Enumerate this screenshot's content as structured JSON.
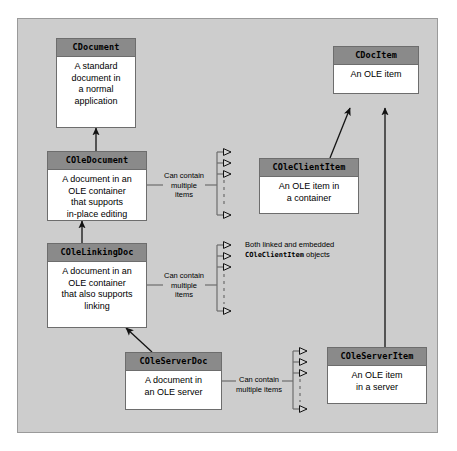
{
  "diagram": {
    "type": "uml-class-diagram",
    "panel_background": "#cdcdcd",
    "header_fill": "#8a8a8a",
    "body_fill": "#ffffff",
    "line_color": "#6d6d6d"
  },
  "classes": [
    {
      "id": "cdocument",
      "name": "CDocument",
      "description": "A standard\ndocument in\na normal\napplication"
    },
    {
      "id": "coledocument",
      "name": "COleDocument",
      "description": "A document in an\nOLE container\nthat supports\nin-place editing"
    },
    {
      "id": "colelinkingdoc",
      "name": "COleLinkingDoc",
      "description": "A document in an\nOLE container\nthat also supports\nlinking"
    },
    {
      "id": "coleserverdoc",
      "name": "COleServerDoc",
      "description": "A document in\nan OLE server"
    },
    {
      "id": "cdocitem",
      "name": "CDocItem",
      "description": "An OLE item"
    },
    {
      "id": "coleclientitem",
      "name": "COleClientItem",
      "description": "An OLE item in\na container"
    },
    {
      "id": "coleserveritem",
      "name": "COleServerItem",
      "description": "An OLE item\nin a server"
    }
  ],
  "edge_labels": {
    "coledocument_contains": "Can contain\nmultiple\nitems",
    "colelinkingdoc_contains": "Can contain\nmultiple\nitems",
    "coleserverdoc_contains": "Can contain\nmultiple items"
  },
  "notes": {
    "linking_note_line1": "Both linked and embedded",
    "linking_note_mono": "COleClientItem",
    "linking_note_line2_tail": " objects"
  },
  "relationships": [
    {
      "from": "coledocument",
      "to": "cdocument",
      "kind": "inheritance"
    },
    {
      "from": "colelinkingdoc",
      "to": "coledocument",
      "kind": "inheritance"
    },
    {
      "from": "coleserverdoc",
      "to": "colelinkingdoc",
      "kind": "inheritance"
    },
    {
      "from": "coleclientitem",
      "to": "cdocitem",
      "kind": "inheritance"
    },
    {
      "from": "coleserveritem",
      "to": "cdocitem",
      "kind": "inheritance"
    },
    {
      "from": "coledocument",
      "to": "coleclientitem",
      "kind": "aggregation-multiple"
    },
    {
      "from": "colelinkingdoc",
      "to": "coleclientitem",
      "kind": "aggregation-multiple"
    },
    {
      "from": "coleserverdoc",
      "to": "coleserveritem",
      "kind": "aggregation-multiple"
    }
  ]
}
